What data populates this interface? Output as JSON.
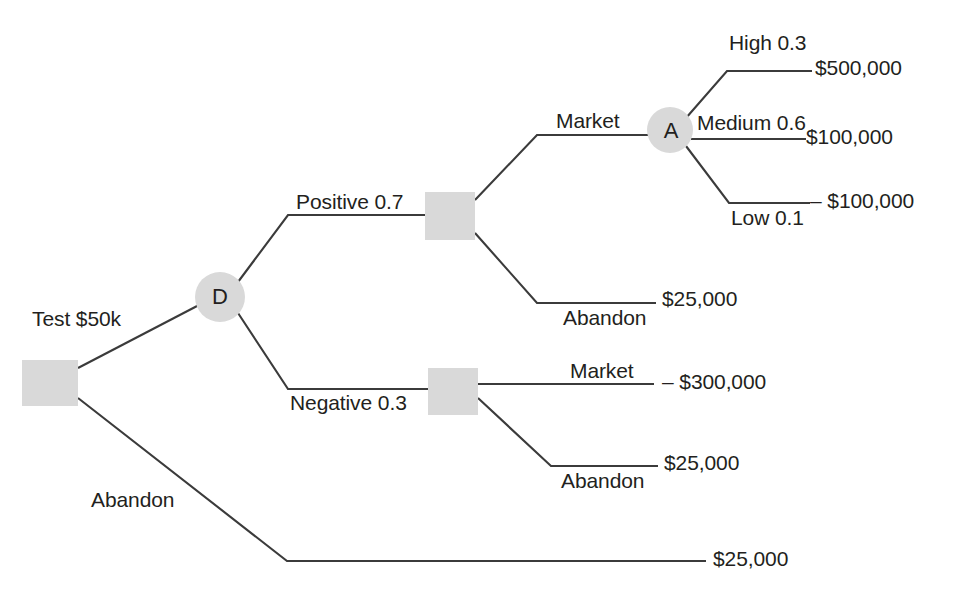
{
  "diagram": {
    "type": "decision-tree",
    "title": "",
    "colors": {
      "line": "#3b3b3b",
      "decision_node_fill": "#d9d9d9",
      "chance_node_fill": "#d9d9d9",
      "text": "#231f20",
      "background": "#ffffff"
    },
    "nodes": [
      {
        "id": "root",
        "shape": "square",
        "letter": "",
        "x": 50,
        "y": 382
      },
      {
        "id": "d",
        "shape": "circle",
        "letter": "D",
        "x": 220,
        "y": 297
      },
      {
        "id": "pos_decision",
        "shape": "square",
        "letter": "",
        "x": 450,
        "y": 216
      },
      {
        "id": "neg_decision",
        "shape": "square",
        "letter": "",
        "x": 453,
        "y": 391
      },
      {
        "id": "a",
        "shape": "circle",
        "letter": "A",
        "x": 670,
        "y": 130
      }
    ],
    "branch_labels": {
      "test": "Test $50k",
      "root_abandon": "Abandon",
      "positive": "Positive 0.7",
      "negative": "Negative 0.3",
      "pos_market": "Market",
      "pos_abandon": "Abandon",
      "neg_market": "Market",
      "neg_abandon": "Abandon",
      "high": "High 0.3",
      "medium": "Medium 0.6",
      "low": "Low 0.1"
    },
    "payoffs": {
      "high": "$500,000",
      "medium": "$100,000",
      "low": "– $100,000",
      "pos_abandon": "$25,000",
      "neg_market": "– $300,000",
      "neg_abandon": "$25,000",
      "root_abandon": "$25,000"
    }
  }
}
